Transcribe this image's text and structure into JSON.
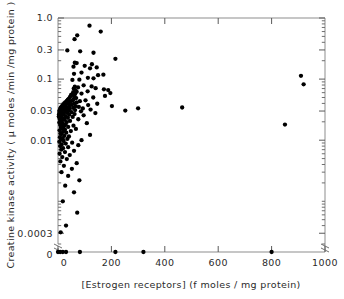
{
  "figure": {
    "title": "",
    "background_color": "#ffffff",
    "marker_color": "#000000",
    "axis_color": "#8d8d8d",
    "width": 344,
    "height": 299
  },
  "axes": {
    "x_title": "[Estrogen receptors]  (f moles / mg protein)",
    "y_title": "Creatine kinase activity ( µ moles /min /mg protein )",
    "x_ticks": [
      "0",
      "200",
      "400",
      "600",
      "800",
      "1000"
    ],
    "y_ticks": [
      "1.0",
      "0.3",
      "0.1",
      "0.03",
      "0.01",
      "0.0003",
      "0"
    ],
    "y_scale": "log",
    "x_scale": "linear",
    "axis_break_label": "0"
  },
  "chart_data": {
    "type": "scatter",
    "title": "",
    "xlabel": "[Estrogen receptors]  (f moles / mg protein)",
    "ylabel": "Creatine kinase activity ( µ moles /min /mg protein )",
    "xlim": [
      0,
      1000
    ],
    "ylim": [
      0.0002,
      1.0
    ],
    "yscale": "log",
    "xscale": "linear",
    "grid": false,
    "legend": false,
    "xticks": [
      0,
      200,
      400,
      600,
      800,
      1000
    ],
    "yticks": [
      1.0,
      0.3,
      0.1,
      0.03,
      0.01,
      0.0003
    ],
    "ytick_labels": [
      "1.0",
      "0.3",
      "0.1",
      "0.03",
      "0.01",
      "0.0003"
    ],
    "series": [
      {
        "name": "tumour samples",
        "marker": "filled-circle",
        "color": "#000000",
        "points": [
          [
            118,
            0.75
          ],
          [
            160,
            0.6
          ],
          [
            72,
            0.52
          ],
          [
            62,
            0.45
          ],
          [
            35,
            0.295
          ],
          [
            83,
            0.285
          ],
          [
            133,
            0.27
          ],
          [
            215,
            0.215
          ],
          [
            63,
            0.185
          ],
          [
            70,
            0.183
          ],
          [
            127,
            0.175
          ],
          [
            100,
            0.165
          ],
          [
            58,
            0.16
          ],
          [
            145,
            0.155
          ],
          [
            120,
            0.15
          ],
          [
            88,
            0.128
          ],
          [
            60,
            0.122
          ],
          [
            170,
            0.118
          ],
          [
            150,
            0.116
          ],
          [
            910,
            0.113
          ],
          [
            112,
            0.105
          ],
          [
            133,
            0.103
          ],
          [
            80,
            0.098
          ],
          [
            54,
            0.097
          ],
          [
            920,
            0.082
          ],
          [
            96,
            0.079
          ],
          [
            126,
            0.076
          ],
          [
            63,
            0.075
          ],
          [
            75,
            0.073
          ],
          [
            141,
            0.071
          ],
          [
            59,
            0.07
          ],
          [
            172,
            0.068
          ],
          [
            188,
            0.066
          ],
          [
            66,
            0.065
          ],
          [
            111,
            0.063
          ],
          [
            70,
            0.062
          ],
          [
            57,
            0.061
          ],
          [
            196,
            0.059
          ],
          [
            88,
            0.058
          ],
          [
            64,
            0.057
          ],
          [
            53,
            0.056
          ],
          [
            49,
            0.055
          ],
          [
            176,
            0.053
          ],
          [
            61,
            0.052
          ],
          [
            45,
            0.051
          ],
          [
            132,
            0.05
          ],
          [
            68,
            0.049
          ],
          [
            41,
            0.048
          ],
          [
            58,
            0.047
          ],
          [
            37,
            0.046
          ],
          [
            103,
            0.045
          ],
          [
            54,
            0.0445
          ],
          [
            33,
            0.044
          ],
          [
            82,
            0.0435
          ],
          [
            46,
            0.043
          ],
          [
            28,
            0.042
          ],
          [
            70,
            0.0415
          ],
          [
            39,
            0.041
          ],
          [
            24,
            0.0405
          ],
          [
            61,
            0.04
          ],
          [
            147,
            0.0395
          ],
          [
            31,
            0.039
          ],
          [
            19,
            0.0385
          ],
          [
            52,
            0.038
          ],
          [
            113,
            0.0375
          ],
          [
            43,
            0.037
          ],
          [
            16,
            0.0365
          ],
          [
            202,
            0.0362
          ],
          [
            66,
            0.036
          ],
          [
            27,
            0.0355
          ],
          [
            13,
            0.0352
          ],
          [
            78,
            0.035
          ],
          [
            36,
            0.0345
          ],
          [
            465,
            0.0343
          ],
          [
            10,
            0.034
          ],
          [
            57,
            0.0337
          ],
          [
            22,
            0.0334
          ],
          [
            300,
            0.0332
          ],
          [
            93,
            0.033
          ],
          [
            44,
            0.0327
          ],
          [
            8,
            0.0324
          ],
          [
            31,
            0.032
          ],
          [
            122,
            0.0317
          ],
          [
            18,
            0.0314
          ],
          [
            64,
            0.0311
          ],
          [
            6,
            0.0308
          ],
          [
            252,
            0.0305
          ],
          [
            40,
            0.0302
          ],
          [
            14,
            0.03
          ],
          [
            86,
            0.0297
          ],
          [
            27,
            0.0293
          ],
          [
            5,
            0.029
          ],
          [
            51,
            0.0287
          ],
          [
            11,
            0.0284
          ],
          [
            34,
            0.0281
          ],
          [
            140,
            0.0278
          ],
          [
            7,
            0.0275
          ],
          [
            21,
            0.0272
          ],
          [
            62,
            0.0268
          ],
          [
            4,
            0.0265
          ],
          [
            42,
            0.0262
          ],
          [
            16,
            0.0258
          ],
          [
            96,
            0.0255
          ],
          [
            9,
            0.0251
          ],
          [
            29,
            0.0248
          ],
          [
            3,
            0.0244
          ],
          [
            55,
            0.024
          ],
          [
            12,
            0.0236
          ],
          [
            37,
            0.0232
          ],
          [
            20,
            0.0228
          ],
          [
            6,
            0.0224
          ],
          [
            76,
            0.022
          ],
          [
            25,
            0.0216
          ],
          [
            9,
            0.0212
          ],
          [
            45,
            0.0207
          ],
          [
            14,
            0.0203
          ],
          [
            33,
            0.0198
          ],
          [
            5,
            0.0194
          ],
          [
            108,
            0.019
          ],
          [
            18,
            0.0186
          ],
          [
            28,
            0.0182
          ],
          [
            850,
            0.018
          ],
          [
            8,
            0.0177
          ],
          [
            58,
            0.0173
          ],
          [
            22,
            0.0169
          ],
          [
            38,
            0.0165
          ],
          [
            11,
            0.0161
          ],
          [
            15,
            0.0157
          ],
          [
            67,
            0.0153
          ],
          [
            26,
            0.0149
          ],
          [
            6,
            0.0145
          ],
          [
            48,
            0.0141
          ],
          [
            19,
            0.0137
          ],
          [
            31,
            0.0133
          ],
          [
            9,
            0.0129
          ],
          [
            13,
            0.0126
          ],
          [
            120,
            0.0122
          ],
          [
            24,
            0.0118
          ],
          [
            41,
            0.0115
          ],
          [
            7,
            0.0112
          ],
          [
            17,
            0.0108
          ],
          [
            35,
            0.0105
          ],
          [
            11,
            0.0102
          ],
          [
            88,
            0.01
          ],
          [
            21,
            0.0097
          ],
          [
            5,
            0.0094
          ],
          [
            53,
            0.0091
          ],
          [
            29,
            0.0088
          ],
          [
            14,
            0.0085
          ],
          [
            76,
            0.0083
          ],
          [
            8,
            0.008
          ],
          [
            38,
            0.0077
          ],
          [
            19,
            0.0074
          ],
          [
            12,
            0.007
          ],
          [
            60,
            0.0067
          ],
          [
            26,
            0.0064
          ],
          [
            6,
            0.006
          ],
          [
            44,
            0.0057
          ],
          [
            16,
            0.0053
          ],
          [
            33,
            0.0049
          ],
          [
            9,
            0.0045
          ],
          [
            70,
            0.0042
          ],
          [
            22,
            0.0038
          ],
          [
            52,
            0.0034
          ],
          [
            13,
            0.003
          ],
          [
            38,
            0.0026
          ],
          [
            80,
            0.0022
          ],
          [
            27,
            0.0018
          ],
          [
            60,
            0.0014
          ],
          [
            18,
            0.001
          ],
          [
            72,
            0.00065
          ],
          [
            30,
            0.0004
          ],
          [
            10,
            0.00031
          ]
        ],
        "zero_axis_points": [
          0,
          8,
          18,
          30,
          82,
          215,
          320,
          800
        ]
      }
    ]
  }
}
